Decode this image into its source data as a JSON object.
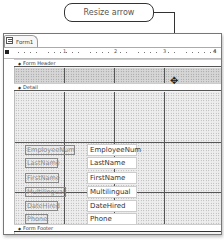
{
  "callout": {
    "label": "Resize arrow"
  },
  "window": {
    "tab_label": "Form1",
    "ruler_numbers": [
      "1",
      "2",
      "3",
      "4"
    ]
  },
  "sections": {
    "header": "Form Header",
    "detail": "Detail",
    "footer": "Form Footer"
  },
  "controls": [
    {
      "label": "EmployeeNum",
      "field": "EmployeeNum"
    },
    {
      "label": "LastName",
      "field": "LastName"
    },
    {
      "label": "FirstName",
      "field": "FirstName"
    },
    {
      "label": "Multilingual",
      "field": "Multilingual"
    },
    {
      "label": "DateHired",
      "field": "DateHired"
    },
    {
      "label": "Phone",
      "field": "Phone"
    }
  ],
  "icons": {
    "resize_arrow": "✥",
    "section_marker": "◆"
  }
}
